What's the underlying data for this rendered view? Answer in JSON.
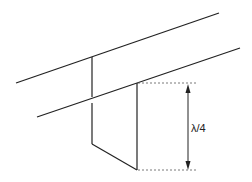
{
  "diagram": {
    "title": "",
    "colors": {
      "line": "#222222",
      "dotted": "#555555",
      "background": "#ffffff"
    },
    "dimension_label": "λ/4",
    "elements": {
      "upper_conductor": {
        "x1": 16,
        "y1": 83,
        "x2": 219,
        "y2": 13
      },
      "lower_conductor": {
        "x1": 37,
        "y1": 117,
        "x2": 240,
        "y2": 48
      },
      "stub_left_vertical": {
        "x": 92,
        "y_top": 57,
        "y_bottom": 144,
        "gap_top": 98,
        "gap_bottom": 102
      },
      "stub_right_vertical": {
        "x": 137,
        "y_top": 83,
        "y_bottom": 170
      },
      "stub_bottom_short": {
        "x1": 92,
        "y1": 144,
        "x2": 137,
        "y2": 170
      },
      "dim_top_dotted": {
        "x1": 138,
        "y1": 83,
        "x2": 196,
        "y2": 83
      },
      "dim_bottom_dotted": {
        "x1": 138,
        "y1": 170,
        "x2": 196,
        "y2": 170
      },
      "dim_arrow": {
        "x": 188,
        "y1": 84,
        "y2": 169
      }
    }
  }
}
